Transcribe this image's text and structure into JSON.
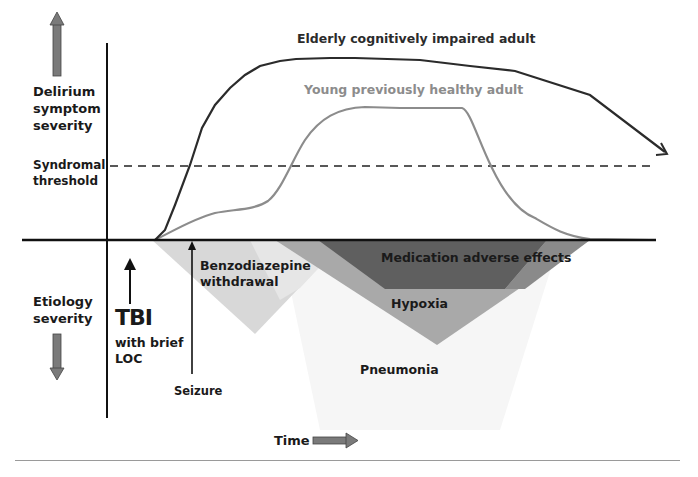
{
  "figure": {
    "y_axis_upper_label": "Delirium symptom severity",
    "y_axis_upper_label_lines": [
      "Delirium",
      "symptom",
      "severity"
    ],
    "y_axis_lower_label_lines": [
      "Etiology",
      "severity"
    ],
    "threshold_label_lines": [
      "Syndromal",
      "threshold"
    ],
    "x_axis_label": "Time",
    "icons": {
      "up_arrow": "gray-up-arrow-icon",
      "down_arrow": "gray-down-arrow-icon",
      "right_arrow": "gray-right-arrow-icon"
    },
    "colors": {
      "axis": "#111111",
      "elderly_curve": "#2b2b2b",
      "young_curve": "#8c8c8c",
      "young_label": "#8c8c8c",
      "benzodiazepine": "#d9d9d9",
      "hypoxia": "#a8a8a8",
      "medication": "#5e5e5e",
      "pneumonia": "#f3f3f3",
      "arrow_fill": "#7a7a7a"
    }
  },
  "curves": {
    "elderly": {
      "label": "Elderly cognitively impaired adult"
    },
    "young": {
      "label": "Young previously healthy adult"
    }
  },
  "events": {
    "tbi": {
      "title": "TBI",
      "sub_lines": [
        "with brief",
        "LOC"
      ]
    },
    "seizure": {
      "label": "Seizure"
    }
  },
  "etiologies": {
    "benzodiazepine": {
      "label_lines": [
        "Benzodiazepine",
        "withdrawal"
      ]
    },
    "medication": {
      "label": "Medication adverse effects"
    },
    "hypoxia": {
      "label": "Hypoxia"
    },
    "pneumonia": {
      "label": "Pneumonia"
    }
  }
}
